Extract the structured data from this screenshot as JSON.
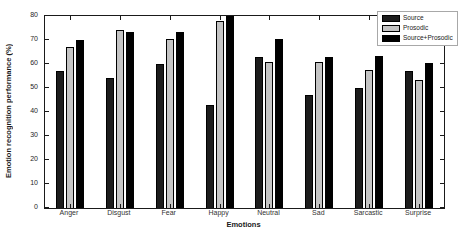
{
  "chart_data": {
    "type": "bar",
    "title": "",
    "xlabel": "Emotions",
    "ylabel": "Emotion recognition performance (%)",
    "ylim": [
      0,
      80
    ],
    "ytick_labels": [
      0,
      10,
      20,
      30,
      40,
      50,
      60,
      70,
      80
    ],
    "grid": false,
    "legend_position": "top-right",
    "categories": [
      "Anger",
      "Disgust",
      "Fear",
      "Happy",
      "Neutral",
      "Sad",
      "Sarcastic",
      "Surprise"
    ],
    "series": [
      {
        "name": "Source",
        "color": "#1c1c1c",
        "values": [
          57,
          54,
          60,
          43,
          63,
          47,
          50,
          57
        ]
      },
      {
        "name": "Prosodic",
        "color": "#c4c4c4",
        "values": [
          67,
          74,
          70.5,
          78,
          61,
          61,
          57.5,
          53.5
        ]
      },
      {
        "name": "Source+Prosodic",
        "color": "#000000",
        "values": [
          70,
          73.5,
          73.5,
          80,
          70.5,
          63,
          63.5,
          60.5
        ]
      }
    ]
  },
  "colors": {
    "axis": "#1a1a1a",
    "legend_border": "#a8a8a8",
    "background": "#ffffff"
  }
}
